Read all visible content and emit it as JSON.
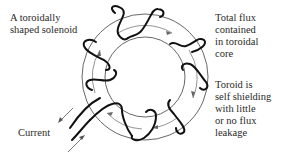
{
  "figure": {
    "labels": {
      "solenoid": "A toroidally\nshaped solenoid",
      "flux": "Total flux\ncontained\nin toroidal\ncore",
      "shielding": "Toroid is\nself shielding\nwith little\nor no flux\nleakage",
      "current": "Current"
    },
    "toroid": {
      "center": [
        145,
        77
      ],
      "outer_radius": 63,
      "inner_radius": 40,
      "flux_path_radius": 52,
      "winding_count": 8,
      "flux_direction": "clockwise",
      "colors": {
        "core_outline": "#555555",
        "winding": "#111111",
        "flux_arrow": "#555555"
      }
    },
    "leads": {
      "direction_arrows": [
        "in",
        "out"
      ]
    }
  }
}
